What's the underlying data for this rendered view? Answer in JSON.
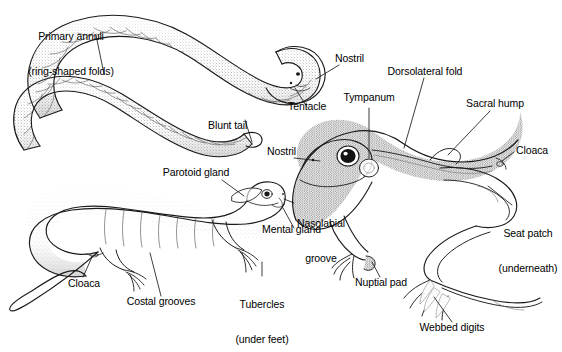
{
  "figure": {
    "background_color": "#ffffff",
    "ink_color": "#1a1a1a",
    "text_color": "#000000"
  },
  "organisms": [
    {
      "name": "caecilian",
      "common": "caecilian (legless amphibian)"
    },
    {
      "name": "salamander",
      "common": "salamander"
    },
    {
      "name": "frog",
      "common": "frog"
    }
  ],
  "labels": {
    "primary_annuli_line1": "Primary annuli",
    "primary_annuli_line2": "(ring-shaped folds)",
    "blunt_tail": "Blunt tail",
    "tentacle": "Tentacle",
    "nostril_caecilian": "Nostril",
    "nostril_frog": "Nostril",
    "tympanum": "Tympanum",
    "dorsolateral_fold": "Dorsolateral fold",
    "sacral_hump": "Sacral hump",
    "cloaca_frog": "Cloaca",
    "seat_patch_line1": "Seat patch",
    "seat_patch_line2": "(underneath)",
    "nuptial_pad": "Nuptial pad",
    "webbed_digits": "Webbed digits",
    "parotoid_gland": "Parotoid gland",
    "nasolabial_line1": "Nasolabial",
    "nasolabial_line2": "groove",
    "mental_gland": "Mental gland",
    "cloaca_salamander": "Cloaca",
    "costal_grooves": "Costal grooves",
    "tubercles_line1": "Tubercles",
    "tubercles_line2": "(under feet)"
  }
}
